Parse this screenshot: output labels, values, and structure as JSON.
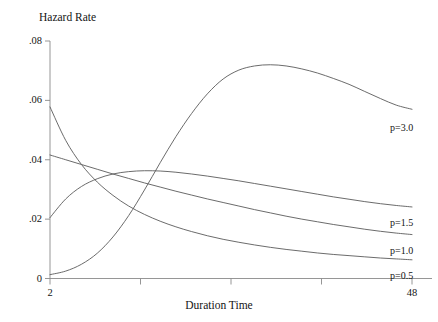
{
  "chart_data": {
    "type": "line",
    "title": "",
    "ylabel": "Hazard Rate",
    "xlabel": "Duration Time",
    "xlim": [
      2,
      48
    ],
    "ylim": [
      0,
      0.08
    ],
    "grid": false,
    "legend_position": "right-inline",
    "x_ticks": [
      {
        "value": 2,
        "label": "2"
      },
      {
        "value": 13.5,
        "label": ""
      },
      {
        "value": 25,
        "label": ""
      },
      {
        "value": 36.5,
        "label": ""
      },
      {
        "value": 48,
        "label": "48"
      }
    ],
    "y_ticks": [
      {
        "value": 0.08,
        "label": ".08"
      },
      {
        "value": 0.06,
        "label": ".06"
      },
      {
        "value": 0.04,
        "label": ".04"
      },
      {
        "value": 0.02,
        "label": ".02"
      },
      {
        "value": 0.0,
        "label": "0"
      }
    ],
    "line_color": "#5a5a5a",
    "axis_color": "#8a8a8a",
    "series": [
      {
        "name": "p=3.0",
        "label": "p=3.0",
        "x": [
          2,
          4,
          6,
          8,
          10,
          12,
          14,
          16,
          18,
          20,
          22,
          24,
          26,
          28,
          30,
          32,
          34,
          36,
          38,
          40,
          42,
          44,
          46,
          48
        ],
        "values": [
          0.0013,
          0.0025,
          0.0048,
          0.0085,
          0.014,
          0.0212,
          0.0298,
          0.039,
          0.0478,
          0.0556,
          0.0622,
          0.0672,
          0.0702,
          0.0716,
          0.072,
          0.0716,
          0.0706,
          0.0692,
          0.0674,
          0.0654,
          0.063,
          0.0606,
          0.0584,
          0.057
        ]
      },
      {
        "name": "p=1.5",
        "label": "p=1.5",
        "x": [
          2,
          4,
          6,
          8,
          10,
          12,
          14,
          16,
          18,
          20,
          22,
          24,
          26,
          28,
          30,
          32,
          34,
          36,
          38,
          40,
          42,
          44,
          46,
          48
        ],
        "values": [
          0.0205,
          0.0268,
          0.031,
          0.0336,
          0.0352,
          0.036,
          0.0363,
          0.0362,
          0.0358,
          0.0352,
          0.0345,
          0.0337,
          0.0329,
          0.032,
          0.0311,
          0.0302,
          0.0293,
          0.0284,
          0.0275,
          0.0267,
          0.0259,
          0.0252,
          0.0246,
          0.0241
        ]
      },
      {
        "name": "p=1.0",
        "label": "p=1.0",
        "x": [
          2,
          4,
          6,
          8,
          10,
          12,
          14,
          16,
          18,
          20,
          22,
          24,
          26,
          28,
          30,
          32,
          34,
          36,
          38,
          40,
          42,
          44,
          46,
          48
        ],
        "values": [
          0.0416,
          0.04,
          0.0384,
          0.0368,
          0.0352,
          0.0337,
          0.0322,
          0.0308,
          0.0294,
          0.0281,
          0.0268,
          0.0256,
          0.0244,
          0.0232,
          0.0221,
          0.021,
          0.02,
          0.0191,
          0.0182,
          0.0174,
          0.0166,
          0.0159,
          0.0153,
          0.0148
        ]
      },
      {
        "name": "p=0.5",
        "label": "p=0.5",
        "x": [
          2,
          4,
          6,
          8,
          10,
          12,
          14,
          16,
          18,
          20,
          22,
          24,
          26,
          28,
          30,
          32,
          34,
          36,
          38,
          40,
          42,
          44,
          46,
          48
        ],
        "values": [
          0.0578,
          0.0465,
          0.0384,
          0.0325,
          0.028,
          0.0244,
          0.0216,
          0.0193,
          0.0174,
          0.0158,
          0.0144,
          0.0132,
          0.0122,
          0.0113,
          0.0105,
          0.0098,
          0.0092,
          0.0086,
          0.0081,
          0.0077,
          0.0073,
          0.0069,
          0.0066,
          0.0063
        ]
      }
    ]
  }
}
